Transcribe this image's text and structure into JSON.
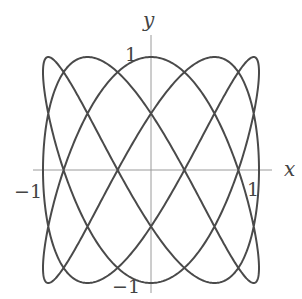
{
  "chart_data": {
    "type": "line",
    "title": "",
    "xlabel": "x",
    "ylabel": "y",
    "parametric": {
      "x": "sin(3t)",
      "y": "cos(5t)",
      "t_range": [
        0,
        6.283185307
      ]
    },
    "xlim": [
      -1,
      1
    ],
    "ylim": [
      -1,
      1
    ],
    "ticks": {
      "x": [
        {
          "value": -1,
          "label": "−1"
        },
        {
          "value": 1,
          "label": "1"
        }
      ],
      "y": [
        {
          "value": 1,
          "label": "1"
        },
        {
          "value": -1,
          "label": "−1"
        }
      ]
    },
    "grid": false,
    "legend": null,
    "line_color": "#4a4a4a",
    "axis_color": "#9a9a9a"
  }
}
